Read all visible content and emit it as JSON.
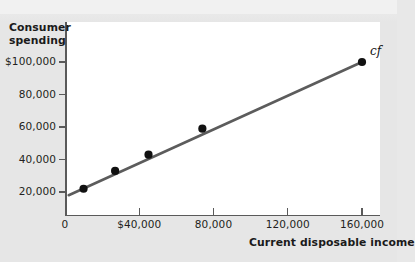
{
  "figure": {
    "background_color": "#e6e6e6",
    "plot_background_color": "#ffffff",
    "axis_color": "#5a5a5a",
    "line_color": "#5c5c5c",
    "point_color": "#111111"
  },
  "chart_data": {
    "type": "scatter",
    "title": "",
    "ylabel_line1": "Consumer",
    "ylabel_line2": "spending",
    "xlabel": "Current disposable income",
    "xlim": [
      0,
      172000
    ],
    "ylim": [
      0,
      112000
    ],
    "grid": false,
    "legend": "none",
    "x_ticks": [
      {
        "value": 0,
        "label": "0"
      },
      {
        "value": 40000,
        "label": "$40,000"
      },
      {
        "value": 80000,
        "label": "80,000"
      },
      {
        "value": 120000,
        "label": "120,000"
      },
      {
        "value": 160000,
        "label": "160,000"
      }
    ],
    "y_ticks": [
      {
        "value": 20000,
        "label": "20,000"
      },
      {
        "value": 40000,
        "label": "40,000"
      },
      {
        "value": 60000,
        "label": "60,000"
      },
      {
        "value": 80000,
        "label": "80,000"
      },
      {
        "value": 100000,
        "label": "$100,000"
      }
    ],
    "series": [
      {
        "name": "cf",
        "annotation": "cf",
        "type": "scatter-with-fit-line",
        "points": [
          {
            "x": 10000,
            "y": 22000
          },
          {
            "x": 27000,
            "y": 33000
          },
          {
            "x": 45000,
            "y": 43000
          },
          {
            "x": 74000,
            "y": 59000
          },
          {
            "x": 160000,
            "y": 100000
          }
        ],
        "fit_line": {
          "x_start": 2000,
          "y_start": 18000,
          "x_end": 160000,
          "y_end": 100000
        }
      }
    ]
  }
}
